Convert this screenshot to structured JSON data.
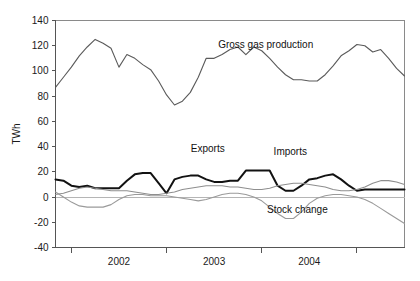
{
  "chart_data": {
    "type": "line",
    "title": "",
    "xlabel": "",
    "ylabel": "TWh",
    "ylim": [
      -40,
      140
    ],
    "yticks": [
      -40,
      -20,
      0,
      20,
      40,
      60,
      80,
      100,
      120,
      140
    ],
    "ytick_labels": [
      "-40",
      "-20",
      "0",
      "20",
      "40",
      "60",
      "80",
      "100",
      "120",
      "140"
    ],
    "xlim": [
      0,
      44
    ],
    "xticks": [
      2,
      14,
      26,
      38
    ],
    "xtick_labels": [
      "",
      "",
      "",
      ""
    ],
    "xcategory_labels": [
      "2002",
      "2003",
      "2004"
    ],
    "xcategory_positions": [
      8,
      20,
      32
    ],
    "grid": false,
    "legend_position": "inline-annotations",
    "annotations": [
      {
        "text": "Gross gas production",
        "x": 26.5,
        "y": 118,
        "name": "gross-gas-production-label"
      },
      {
        "text": "Exports",
        "x": 19.2,
        "y": 36,
        "name": "exports-label"
      },
      {
        "text": "Imports",
        "x": 29.6,
        "y": 33,
        "name": "imports-label"
      },
      {
        "text": "Stock change",
        "x": 30.5,
        "y": -13,
        "name": "stock-change-label"
      }
    ],
    "series": [
      {
        "name": "Gross gas production",
        "color": "#5a5a5a",
        "width": 1.1,
        "x": [
          0,
          1,
          2,
          3,
          4,
          5,
          6,
          7,
          8,
          9,
          10,
          11,
          12,
          13,
          14,
          15,
          16,
          17,
          18,
          19,
          20,
          21,
          22,
          23,
          24,
          25,
          26,
          27,
          28,
          29,
          30,
          31,
          32,
          33,
          34,
          35,
          36,
          37,
          38,
          39,
          40,
          41,
          42,
          43,
          44
        ],
        "values": [
          87,
          95,
          103,
          112,
          119,
          125,
          122,
          118,
          103,
          113,
          110,
          105,
          101,
          92,
          81,
          73,
          76,
          83,
          95,
          110,
          110,
          113,
          117,
          119,
          113,
          119,
          116,
          110,
          103,
          97,
          93,
          93,
          92,
          92,
          97,
          104,
          112,
          116,
          121,
          120,
          115,
          117,
          110,
          102,
          96
        ]
      },
      {
        "name": "Exports",
        "color": "#121212",
        "width": 2.0,
        "x": [
          0,
          1,
          2,
          3,
          4,
          5,
          6,
          7,
          8,
          9,
          10,
          11,
          12,
          13,
          14,
          15,
          16,
          17,
          18,
          19,
          20,
          21,
          22,
          23,
          24,
          25,
          26,
          27,
          28,
          29,
          30,
          31,
          32,
          33,
          34,
          35,
          36,
          37,
          38,
          39,
          40,
          41,
          42,
          43,
          44
        ],
        "values": [
          14,
          13,
          9,
          8,
          9,
          7,
          7,
          7,
          7,
          13,
          18,
          19,
          19,
          11,
          3,
          14,
          16,
          17,
          17,
          14,
          12,
          12,
          13,
          13,
          21,
          21,
          21,
          21,
          9,
          5,
          5,
          9,
          14,
          15,
          17,
          18,
          14,
          9,
          5,
          6,
          6,
          6,
          6,
          6,
          6
        ]
      },
      {
        "name": "Imports",
        "color": "#8e8e8e",
        "width": 1.1,
        "x": [
          0,
          1,
          2,
          3,
          4,
          5,
          6,
          7,
          8,
          9,
          10,
          11,
          12,
          13,
          14,
          15,
          16,
          17,
          18,
          19,
          20,
          21,
          22,
          23,
          24,
          25,
          26,
          27,
          28,
          29,
          30,
          31,
          32,
          33,
          34,
          35,
          36,
          37,
          38,
          39,
          40,
          41,
          42,
          43,
          44
        ],
        "values": [
          2,
          3,
          5,
          7,
          8,
          7,
          6,
          5,
          5,
          5,
          4,
          3,
          2,
          2,
          3,
          4,
          6,
          7,
          8,
          9,
          9,
          9,
          8,
          8,
          7,
          6,
          6,
          7,
          9,
          10,
          11,
          11,
          10,
          9,
          8,
          6,
          5,
          5,
          6,
          8,
          11,
          13,
          13,
          12,
          10
        ]
      },
      {
        "name": "Stock change",
        "color": "#9a9a9a",
        "width": 1.1,
        "x": [
          0,
          1,
          2,
          3,
          4,
          5,
          6,
          7,
          8,
          9,
          10,
          11,
          12,
          13,
          14,
          15,
          16,
          17,
          18,
          19,
          20,
          21,
          22,
          23,
          24,
          25,
          26,
          27,
          28,
          29,
          30,
          31,
          32,
          33,
          34,
          35,
          36,
          37,
          38,
          39,
          40,
          41,
          42,
          43,
          44
        ],
        "values": [
          4,
          0,
          -4,
          -7,
          -8,
          -8,
          -8,
          -6,
          -2,
          1,
          2,
          2,
          1,
          1,
          1,
          0,
          -1,
          -2,
          -3,
          -2,
          0,
          2,
          3,
          3,
          2,
          0,
          -3,
          -8,
          -13,
          -17,
          -17,
          -12,
          -5,
          -1,
          1,
          2,
          2,
          1,
          0,
          -2,
          -5,
          -9,
          -13,
          -17,
          -21
        ]
      }
    ]
  }
}
